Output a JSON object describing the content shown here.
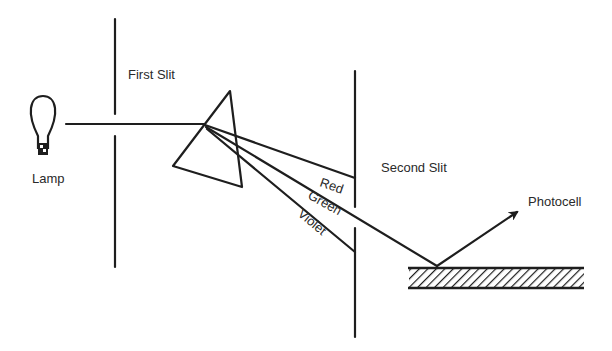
{
  "diagram": {
    "labels": {
      "lamp": "Lamp",
      "first_slit": "First Slit",
      "second_slit": "Second Slit",
      "photocell": "Photocell",
      "red": "Red",
      "green": "Green",
      "violet": "Violet"
    },
    "colors": {
      "ink": "#1e1e1e",
      "text": "#2a2a2a",
      "background": "#ffffff"
    }
  }
}
